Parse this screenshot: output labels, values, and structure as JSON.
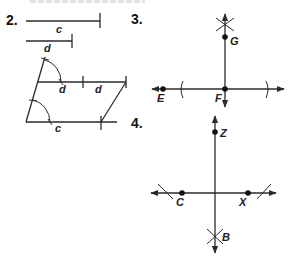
{
  "problems": {
    "p2": {
      "number": "2.",
      "segments": [
        {
          "label": "c"
        },
        {
          "label": "d"
        }
      ],
      "construction_labels": {
        "top_left": "d",
        "top_right": "d",
        "bottom": "c"
      }
    },
    "p3": {
      "number": "3.",
      "points": {
        "E": "E",
        "F": "F",
        "G": "G"
      }
    },
    "p4": {
      "number": "4.",
      "points": {
        "Z": "Z",
        "C": "C",
        "X": "X",
        "B": "B"
      }
    }
  },
  "colors": {
    "ink": "#2a2a2a",
    "background": "#ffffff"
  }
}
